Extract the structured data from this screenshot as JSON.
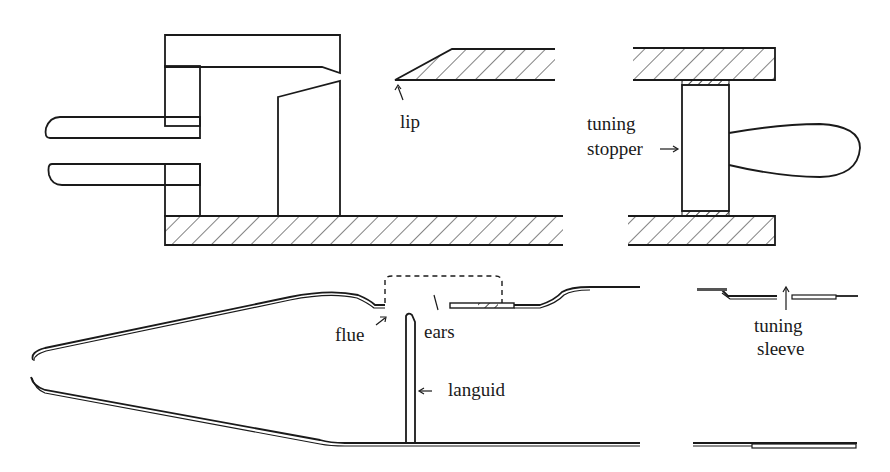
{
  "figure": {
    "colors": {
      "ink": "#1a1a1a",
      "background": "#ffffff"
    },
    "panels": [
      {
        "id": "wooden-pipe",
        "description": "Wooden flue pipe cross-section with foot, languid, lip and tuning stopper",
        "labels": {
          "lip": "lip",
          "tuning_stopper_line1": "tuning",
          "tuning_stopper_line2": "stopper"
        }
      },
      {
        "id": "metal-pipe",
        "description": "Metal flue pipe cross-section with conical foot, flue, languid, ears and tuning sleeve",
        "labels": {
          "flue": "flue",
          "ears": "ears",
          "languid": "languid",
          "tuning_sleeve_line1": "tuning",
          "tuning_sleeve_line2": "sleeve"
        }
      }
    ]
  }
}
